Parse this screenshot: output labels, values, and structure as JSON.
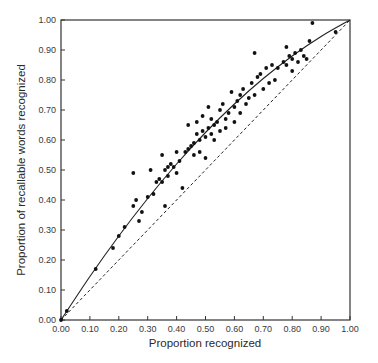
{
  "chart_data": {
    "type": "scatter",
    "title": "",
    "xlabel": "Proportion recognized",
    "ylabel": "Proportion of recallable words recognized",
    "xlim": [
      0,
      1
    ],
    "ylim": [
      0,
      1
    ],
    "grid": false,
    "legend": null,
    "x_ticks": [
      "0.00",
      "0.10",
      "0.20",
      "0.30",
      "0.40",
      "0.50",
      "0.60",
      "0.70",
      "0.80",
      "0.90",
      "1.00"
    ],
    "y_ticks": [
      "0.00",
      "0.10",
      "0.20",
      "0.30",
      "0.40",
      "0.50",
      "0.60",
      "0.70",
      "0.80",
      "0.90",
      "1.00"
    ],
    "series": [
      {
        "name": "observed",
        "kind": "points",
        "points": [
          [
            0.0,
            0.0
          ],
          [
            0.02,
            0.03
          ],
          [
            0.12,
            0.17
          ],
          [
            0.18,
            0.24
          ],
          [
            0.2,
            0.28
          ],
          [
            0.22,
            0.31
          ],
          [
            0.25,
            0.38
          ],
          [
            0.26,
            0.4
          ],
          [
            0.25,
            0.49
          ],
          [
            0.27,
            0.33
          ],
          [
            0.28,
            0.36
          ],
          [
            0.3,
            0.41
          ],
          [
            0.32,
            0.42
          ],
          [
            0.31,
            0.5
          ],
          [
            0.33,
            0.46
          ],
          [
            0.34,
            0.47
          ],
          [
            0.35,
            0.46
          ],
          [
            0.35,
            0.55
          ],
          [
            0.36,
            0.5
          ],
          [
            0.36,
            0.38
          ],
          [
            0.37,
            0.51
          ],
          [
            0.38,
            0.52
          ],
          [
            0.37,
            0.48
          ],
          [
            0.39,
            0.51
          ],
          [
            0.4,
            0.49
          ],
          [
            0.41,
            0.53
          ],
          [
            0.4,
            0.56
          ],
          [
            0.42,
            0.44
          ],
          [
            0.43,
            0.56
          ],
          [
            0.44,
            0.57
          ],
          [
            0.44,
            0.65
          ],
          [
            0.45,
            0.58
          ],
          [
            0.46,
            0.59
          ],
          [
            0.46,
            0.55
          ],
          [
            0.47,
            0.62
          ],
          [
            0.47,
            0.66
          ],
          [
            0.48,
            0.6
          ],
          [
            0.48,
            0.56
          ],
          [
            0.49,
            0.63
          ],
          [
            0.49,
            0.68
          ],
          [
            0.5,
            0.61
          ],
          [
            0.5,
            0.54
          ],
          [
            0.51,
            0.64
          ],
          [
            0.51,
            0.71
          ],
          [
            0.52,
            0.62
          ],
          [
            0.52,
            0.67
          ],
          [
            0.53,
            0.65
          ],
          [
            0.53,
            0.6
          ],
          [
            0.54,
            0.66
          ],
          [
            0.55,
            0.7
          ],
          [
            0.55,
            0.63
          ],
          [
            0.56,
            0.72
          ],
          [
            0.57,
            0.67
          ],
          [
            0.57,
            0.64
          ],
          [
            0.58,
            0.69
          ],
          [
            0.59,
            0.76
          ],
          [
            0.6,
            0.71
          ],
          [
            0.6,
            0.66
          ],
          [
            0.61,
            0.73
          ],
          [
            0.62,
            0.75
          ],
          [
            0.62,
            0.69
          ],
          [
            0.63,
            0.77
          ],
          [
            0.64,
            0.72
          ],
          [
            0.65,
            0.74
          ],
          [
            0.66,
            0.79
          ],
          [
            0.67,
            0.75
          ],
          [
            0.67,
            0.89
          ],
          [
            0.68,
            0.81
          ],
          [
            0.69,
            0.82
          ],
          [
            0.7,
            0.77
          ],
          [
            0.71,
            0.84
          ],
          [
            0.72,
            0.79
          ],
          [
            0.73,
            0.85
          ],
          [
            0.74,
            0.8
          ],
          [
            0.75,
            0.84
          ],
          [
            0.77,
            0.86
          ],
          [
            0.78,
            0.85
          ],
          [
            0.78,
            0.91
          ],
          [
            0.79,
            0.88
          ],
          [
            0.8,
            0.87
          ],
          [
            0.8,
            0.83
          ],
          [
            0.81,
            0.89
          ],
          [
            0.82,
            0.86
          ],
          [
            0.83,
            0.9
          ],
          [
            0.84,
            0.88
          ],
          [
            0.85,
            0.87
          ],
          [
            0.86,
            0.93
          ],
          [
            0.87,
            0.99
          ],
          [
            0.95,
            0.96
          ]
        ]
      },
      {
        "name": "fitted curve",
        "kind": "line",
        "style": "solid",
        "points": [
          [
            0,
            0
          ],
          [
            0.1,
            0.145
          ],
          [
            0.2,
            0.28
          ],
          [
            0.3,
            0.405
          ],
          [
            0.4,
            0.52
          ],
          [
            0.5,
            0.625
          ],
          [
            0.6,
            0.72
          ],
          [
            0.7,
            0.805
          ],
          [
            0.8,
            0.88
          ],
          [
            0.9,
            0.945
          ],
          [
            1,
            1
          ]
        ]
      },
      {
        "name": "chance diagonal",
        "kind": "line",
        "style": "dashed",
        "points": [
          [
            0,
            0
          ],
          [
            1,
            1
          ]
        ]
      }
    ]
  }
}
